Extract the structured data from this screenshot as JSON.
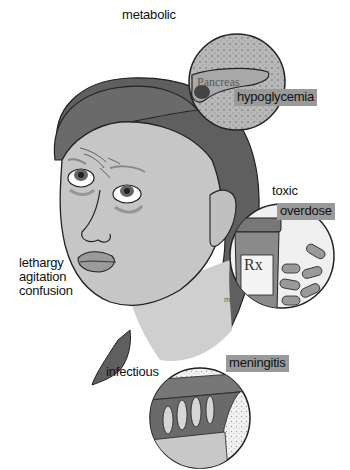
{
  "symptoms": {
    "lines": [
      "lethargy",
      "agitation",
      "confusion"
    ]
  },
  "categories": [
    {
      "category": "metabolic",
      "cause": "hypoglycemia",
      "organ_label": "Pancreas"
    },
    {
      "category": "toxic",
      "cause": "overdose",
      "bottle_label": "Rx",
      "bottle_sub": "x"
    },
    {
      "category": "infectious",
      "cause": "meningitis"
    }
  ],
  "artist_signature": "mjw",
  "colors": {
    "tag_bg": "#9a9a9a",
    "hair": "#5f5f5f",
    "skin": "#c8c8c8",
    "outline": "#222222"
  }
}
